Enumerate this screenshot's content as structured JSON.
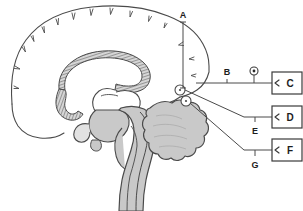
{
  "figure": {
    "kind": "labeled-anatomical-diagram",
    "background_color": "#ffffff",
    "line_color": "#3a3a3a",
    "text_color": "#1d1d1d",
    "fill_gray": "#c9c9c9",
    "fill_light": "#e2e2e2",
    "hatch_color": "#6e6e6e"
  },
  "leader_labels": {
    "a": "A",
    "b": "B",
    "e": "E",
    "g": "G"
  },
  "answer_boxes": [
    {
      "id": "box-c",
      "label": "C"
    },
    {
      "id": "box-d",
      "label": "D"
    },
    {
      "id": "box-f",
      "label": "F"
    }
  ],
  "markers": {
    "pointer_circle_upper": "target-circle",
    "pointer_circle_lower": "target-circle",
    "dot_marker": "circled-dot-marker"
  }
}
